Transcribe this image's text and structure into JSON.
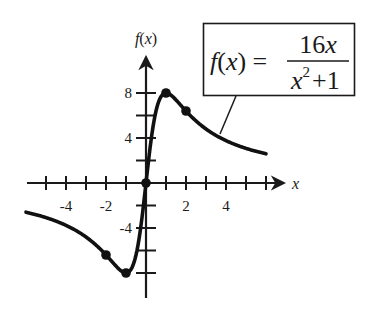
{
  "chart_data": {
    "type": "line",
    "title": "",
    "function_label": "f(x) = 16x / (x^2 + 1)",
    "formula": {
      "lhs": "f(x) =",
      "numerator": "16x",
      "denominator_base": "x",
      "denominator_exp": "2",
      "denominator_rest": " +1"
    },
    "xlabel": "x",
    "ylabel": "f(x)",
    "xlim": [
      -6,
      6
    ],
    "ylim": [
      -10,
      10
    ],
    "x_tick_labels": [
      {
        "value": -4,
        "label": "-4"
      },
      {
        "value": -2,
        "label": "-2"
      },
      {
        "value": 2,
        "label": "2"
      },
      {
        "value": 4,
        "label": "4"
      }
    ],
    "y_tick_labels": [
      {
        "value": 8,
        "label": "8"
      },
      {
        "value": 4,
        "label": "4"
      },
      {
        "value": -4,
        "label": "-4"
      }
    ],
    "x_ticks": [
      -5,
      -4,
      -3,
      -2,
      -1,
      1,
      2,
      3,
      4,
      5,
      6
    ],
    "y_ticks": [
      -8,
      -6,
      -4,
      -2,
      2,
      4,
      6,
      8
    ],
    "marked_points": [
      {
        "x": 0,
        "y": 0,
        "note": "origin / inflection"
      },
      {
        "x": 1,
        "y": 8,
        "note": "relative maximum"
      },
      {
        "x": 2,
        "y": 6.4
      },
      {
        "x": -1,
        "y": -8,
        "note": "relative minimum"
      },
      {
        "x": -2,
        "y": -6.4
      }
    ],
    "series": [
      {
        "name": "f(x) = 16x/(x^2+1)",
        "domain": [
          -6,
          6
        ],
        "samples": 241
      }
    ],
    "grid": false,
    "legend": "callout box upper right with leader line to curve"
  },
  "layout": {
    "origin_px": [
      146,
      183
    ],
    "x_px_per_unit": 20,
    "y_px_per_unit": 11.25
  }
}
